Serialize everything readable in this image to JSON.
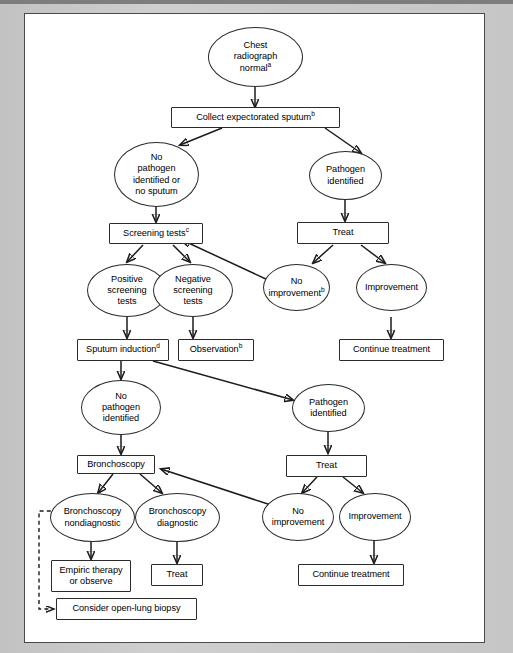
{
  "figure": {
    "type": "clinical-algorithm-flowchart",
    "background_color": "#ffffff",
    "mat_color": "#c9c9c9",
    "line_color": "#1b1b1b"
  },
  "nodes": [
    {
      "id": "n1",
      "shape": "ellipse",
      "label": "Chest\nradiograph\nnormal",
      "footnote": "a"
    },
    {
      "id": "n2",
      "shape": "box",
      "label": "Collect expectorated sputum",
      "footnote": "b"
    },
    {
      "id": "n3",
      "shape": "ellipse",
      "label": "No\npathogen\nidentified or\nno sputum",
      "footnote": ""
    },
    {
      "id": "n4",
      "shape": "ellipse",
      "label": "Pathogen\nidentified",
      "footnote": ""
    },
    {
      "id": "n5",
      "shape": "box",
      "label": "Screening tests",
      "footnote": "c"
    },
    {
      "id": "n6",
      "shape": "box",
      "label": "Treat",
      "footnote": ""
    },
    {
      "id": "n7",
      "shape": "ellipse",
      "label": "Positive\nscreening\ntests",
      "footnote": ""
    },
    {
      "id": "n8",
      "shape": "ellipse",
      "label": "Negative\nscreening\ntests",
      "footnote": ""
    },
    {
      "id": "n9",
      "shape": "ellipse",
      "label": "No\nimprovement",
      "footnote": "b"
    },
    {
      "id": "n10",
      "shape": "ellipse",
      "label": "Improvement",
      "footnote": ""
    },
    {
      "id": "n11",
      "shape": "box",
      "label": "Sputum induction",
      "footnote": "d"
    },
    {
      "id": "n12",
      "shape": "box",
      "label": "Observation",
      "footnote": "b"
    },
    {
      "id": "n13",
      "shape": "box",
      "label": "Continue treatment",
      "footnote": ""
    },
    {
      "id": "n14",
      "shape": "ellipse",
      "label": "No\npathogen\nidentified",
      "footnote": ""
    },
    {
      "id": "n15",
      "shape": "ellipse",
      "label": "Pathogen\nidentified",
      "footnote": ""
    },
    {
      "id": "n16",
      "shape": "box",
      "label": "Bronchoscopy",
      "footnote": ""
    },
    {
      "id": "n17",
      "shape": "box",
      "label": "Treat",
      "footnote": ""
    },
    {
      "id": "n18",
      "shape": "ellipse",
      "label": "Bronchoscopy\nnondiagnostic",
      "footnote": ""
    },
    {
      "id": "n19",
      "shape": "ellipse",
      "label": "Bronchoscopy\ndiagnostic",
      "footnote": ""
    },
    {
      "id": "n20",
      "shape": "ellipse",
      "label": "No\nimprovement",
      "footnote": ""
    },
    {
      "id": "n21",
      "shape": "ellipse",
      "label": "Improvement",
      "footnote": ""
    },
    {
      "id": "n22",
      "shape": "box",
      "label": "Empiric therapy\nor observe",
      "footnote": ""
    },
    {
      "id": "n23",
      "shape": "box",
      "label": "Treat",
      "footnote": ""
    },
    {
      "id": "n24",
      "shape": "box",
      "label": "Continue treatment",
      "footnote": ""
    },
    {
      "id": "n25",
      "shape": "box",
      "label": "Consider open-lung biopsy",
      "footnote": ""
    }
  ],
  "edges": [
    {
      "from": "n1",
      "to": "n2",
      "style": "solid"
    },
    {
      "from": "n2",
      "to": "n3",
      "style": "solid"
    },
    {
      "from": "n2",
      "to": "n4",
      "style": "solid"
    },
    {
      "from": "n3",
      "to": "n5",
      "style": "solid"
    },
    {
      "from": "n4",
      "to": "n6",
      "style": "solid"
    },
    {
      "from": "n5",
      "to": "n7",
      "style": "solid"
    },
    {
      "from": "n5",
      "to": "n8",
      "style": "solid"
    },
    {
      "from": "n6",
      "to": "n9",
      "style": "solid"
    },
    {
      "from": "n6",
      "to": "n10",
      "style": "solid"
    },
    {
      "from": "n9",
      "to": "n5",
      "style": "solid"
    },
    {
      "from": "n7",
      "to": "n11",
      "style": "solid"
    },
    {
      "from": "n8",
      "to": "n12",
      "style": "solid"
    },
    {
      "from": "n10",
      "to": "n13",
      "style": "solid"
    },
    {
      "from": "n11",
      "to": "n14",
      "style": "solid"
    },
    {
      "from": "n11",
      "to": "n15",
      "style": "solid"
    },
    {
      "from": "n14",
      "to": "n16",
      "style": "solid"
    },
    {
      "from": "n15",
      "to": "n17",
      "style": "solid"
    },
    {
      "from": "n16",
      "to": "n18",
      "style": "solid"
    },
    {
      "from": "n16",
      "to": "n19",
      "style": "solid"
    },
    {
      "from": "n17",
      "to": "n20",
      "style": "solid"
    },
    {
      "from": "n17",
      "to": "n21",
      "style": "solid"
    },
    {
      "from": "n20",
      "to": "n16",
      "style": "solid"
    },
    {
      "from": "n18",
      "to": "n22",
      "style": "solid"
    },
    {
      "from": "n19",
      "to": "n23",
      "style": "solid"
    },
    {
      "from": "n21",
      "to": "n24",
      "style": "solid"
    },
    {
      "from": "n18",
      "to": "n25",
      "style": "dashed"
    }
  ]
}
